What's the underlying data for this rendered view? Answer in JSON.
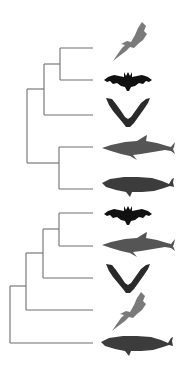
{
  "diagram": {
    "type": "phylogenetic-tree-comparison",
    "colors": {
      "background": "#ffffff",
      "branch": "#6e6e6e",
      "gray_bat": "#7a7a7a",
      "black_bat": "#111111",
      "v_bat": "#2a2a2a",
      "dolphin": "#555555",
      "whale": "#3c3c3c"
    },
    "trees": [
      {
        "name": "top-tree",
        "topology": "((((gray-bat, black-bat), v-bat), (dolphin, whale)))",
        "leaves": [
          {
            "id": "gray-bat",
            "icon": "gray-bat-icon",
            "y": 48
          },
          {
            "id": "black-bat",
            "icon": "black-bat-icon",
            "y": 80
          },
          {
            "id": "v-bat",
            "icon": "v-bat-icon",
            "y": 115
          },
          {
            "id": "dolphin",
            "icon": "dolphin-icon",
            "y": 147
          },
          {
            "id": "whale",
            "icon": "whale-icon",
            "y": 189
          }
        ]
      },
      {
        "name": "bottom-tree",
        "topology": "(((((black-bat, dolphin), v-bat), gray-bat), whale))",
        "leaves": [
          {
            "id": "black-bat",
            "icon": "black-bat-icon",
            "y": 213
          },
          {
            "id": "dolphin",
            "icon": "dolphin-icon",
            "y": 246
          },
          {
            "id": "v-bat",
            "icon": "v-bat-icon",
            "y": 278
          },
          {
            "id": "gray-bat",
            "icon": "gray-bat-icon",
            "y": 310
          },
          {
            "id": "whale",
            "icon": "whale-icon",
            "y": 343
          }
        ]
      }
    ]
  }
}
